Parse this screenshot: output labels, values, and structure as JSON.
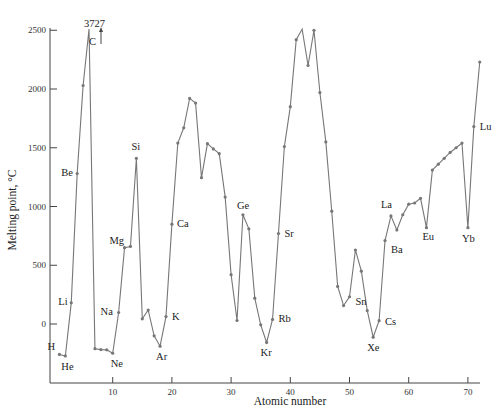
{
  "chart_data": {
    "type": "line",
    "title": "",
    "xlabel": "Atomic number",
    "ylabel": "Melting point, °C",
    "xlim": [
      0,
      73
    ],
    "ylim": [
      -500,
      2500
    ],
    "x_ticks": [
      10,
      20,
      30,
      40,
      50,
      60,
      70
    ],
    "y_ticks": [
      0,
      500,
      1000,
      1500,
      2000,
      2500
    ],
    "grid": false,
    "legend": null,
    "annotations": [
      {
        "text": "3727",
        "note": "Carbon melting point exceeds axis"
      },
      {
        "text": "C",
        "note": "arrow pointing up off-scale"
      }
    ],
    "series": [
      {
        "name": "Melting point",
        "x": [
          1,
          2,
          3,
          4,
          5,
          6,
          7,
          8,
          9,
          10,
          11,
          12,
          13,
          14,
          15,
          16,
          17,
          18,
          19,
          20,
          21,
          22,
          23,
          24,
          25,
          26,
          27,
          28,
          29,
          30,
          31,
          32,
          33,
          34,
          35,
          36,
          37,
          38,
          39,
          40,
          41,
          42,
          43,
          44,
          45,
          46,
          47,
          48,
          49,
          50,
          51,
          52,
          53,
          54,
          55,
          56,
          57,
          58,
          59,
          60,
          61,
          62,
          63,
          64,
          65,
          66,
          67,
          68,
          69,
          70,
          71,
          72
        ],
        "values": [
          -259,
          -272,
          180,
          1280,
          2030,
          3727,
          -210,
          -218,
          -220,
          -249,
          98,
          650,
          660,
          1410,
          44,
          119,
          -101,
          -189,
          63,
          850,
          1540,
          1670,
          1920,
          1880,
          1245,
          1535,
          1490,
          1450,
          1080,
          420,
          30,
          930,
          810,
          220,
          -7,
          -157,
          39,
          770,
          1510,
          1850,
          2420,
          2610,
          2200,
          2500,
          1970,
          1550,
          960,
          320,
          157,
          232,
          630,
          450,
          114,
          -112,
          28,
          710,
          920,
          800,
          930,
          1020,
          1030,
          1070,
          820,
          1310,
          1360,
          1410,
          1460,
          1500,
          1540,
          820,
          1680,
          2230
        ]
      }
    ],
    "element_labels": [
      {
        "symbol": "H",
        "z": 1
      },
      {
        "symbol": "He",
        "z": 2
      },
      {
        "symbol": "Li",
        "z": 3
      },
      {
        "symbol": "Be",
        "z": 4
      },
      {
        "symbol": "C",
        "z": 6
      },
      {
        "symbol": "Ne",
        "z": 10
      },
      {
        "symbol": "Na",
        "z": 11
      },
      {
        "symbol": "Mg",
        "z": 12
      },
      {
        "symbol": "Si",
        "z": 14
      },
      {
        "symbol": "Ar",
        "z": 18
      },
      {
        "symbol": "K",
        "z": 19
      },
      {
        "symbol": "Ca",
        "z": 20
      },
      {
        "symbol": "Ge",
        "z": 32
      },
      {
        "symbol": "Kr",
        "z": 36
      },
      {
        "symbol": "Rb",
        "z": 37
      },
      {
        "symbol": "Sr",
        "z": 38
      },
      {
        "symbol": "Sn",
        "z": 50
      },
      {
        "symbol": "Xe",
        "z": 54
      },
      {
        "symbol": "Cs",
        "z": 55
      },
      {
        "symbol": "Ba",
        "z": 56
      },
      {
        "symbol": "La",
        "z": 57
      },
      {
        "symbol": "Eu",
        "z": 63
      },
      {
        "symbol": "Yb",
        "z": 70
      },
      {
        "symbol": "Lu",
        "z": 71
      }
    ]
  },
  "labels": {
    "x_axis_title": "Atomic number",
    "y_axis_title": "Melting point, °C",
    "carbon_value": "3727",
    "carbon_symbol": "C"
  }
}
